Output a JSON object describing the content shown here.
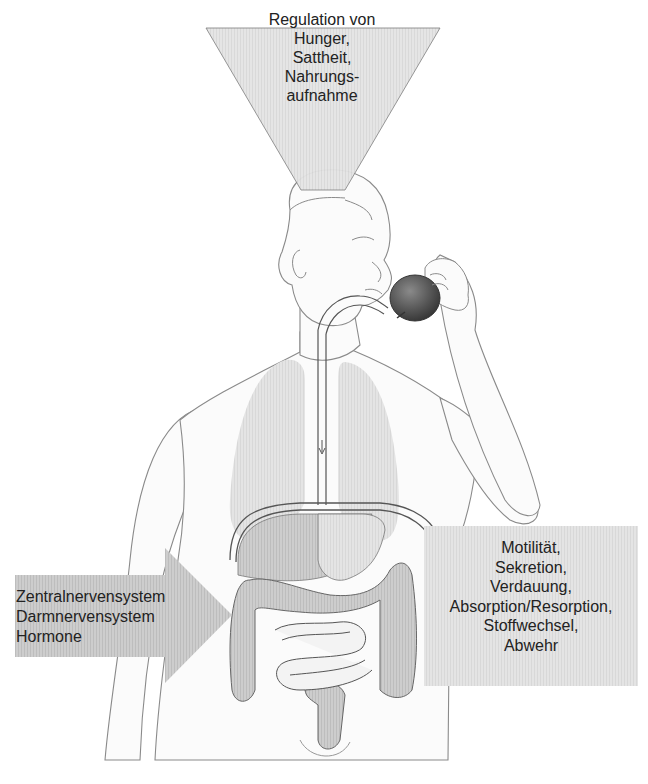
{
  "figure": {
    "type": "anatomical-diagram",
    "colors": {
      "background": "#ffffff",
      "label_box_fill": "#e6e6e6",
      "arrow_fill": "#cfcfcf",
      "outline": "#6e6e6e",
      "organ_fill": "#c8c8c8",
      "lung_fill": "#e2e2e2",
      "apple_fill": "#555555"
    }
  },
  "labels": {
    "top": {
      "shape": "inverted-triangle",
      "lines": [
        "Regulation von",
        "Hunger,",
        "Sattheit,",
        "Nahrungs-",
        "aufnahme"
      ]
    },
    "right": {
      "shape": "box",
      "lines": [
        "Motilität,",
        "Sekretion,",
        "Verdauung,",
        "Absorption/Resorption,",
        "Stoffwechsel,",
        "Abwehr"
      ]
    },
    "left": {
      "shape": "arrow-right",
      "lines": [
        "Zentralnervensystem",
        "Darmnervensystem",
        "Hormone"
      ]
    }
  }
}
